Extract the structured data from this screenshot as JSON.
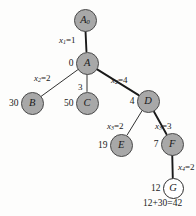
{
  "figure": {
    "type": "branch-and-bound-tree",
    "background_color": "#fdfdfc",
    "node_fill_color": "#a8a8a8",
    "node_open_color": "#ffffff",
    "edge_color": "#1a1a1a",
    "caption": "12+30=42"
  },
  "nodes": [
    {
      "id": "A0",
      "label": "A",
      "subscript": "0",
      "value": "",
      "style": "filled",
      "cx": 85,
      "cy": 20,
      "r": 11.5
    },
    {
      "id": "A",
      "label": "A",
      "subscript": "",
      "value": "0",
      "style": "filled",
      "cx": 87,
      "cy": 63,
      "r": 11.5
    },
    {
      "id": "B",
      "label": "B",
      "subscript": "",
      "value": "30",
      "style": "filled",
      "cx": 32,
      "cy": 103,
      "r": 11.5
    },
    {
      "id": "C",
      "label": "C",
      "subscript": "",
      "value": "50",
      "style": "filled",
      "cx": 87,
      "cy": 103,
      "r": 11.5
    },
    {
      "id": "D",
      "label": "D",
      "subscript": "",
      "value": "4",
      "style": "filled",
      "cx": 148,
      "cy": 101,
      "r": 11.5
    },
    {
      "id": "E",
      "label": "E",
      "subscript": "",
      "value": "19",
      "style": "filled",
      "cx": 121,
      "cy": 145,
      "r": 11.5
    },
    {
      "id": "F",
      "label": "F",
      "subscript": "",
      "value": "7",
      "style": "filled",
      "cx": 172,
      "cy": 144,
      "r": 11.5
    },
    {
      "id": "G",
      "label": "G",
      "subscript": "",
      "value": "12",
      "style": "open",
      "cx": 173,
      "cy": 188,
      "r": 10.5
    }
  ],
  "edges": [
    {
      "id": "A0-A",
      "from": "A0",
      "to": "A",
      "variable": "x",
      "sub": "1",
      "weight": "1",
      "thick": true,
      "label_x": 59,
      "label_y": 36
    },
    {
      "id": "A-B",
      "from": "A",
      "to": "B",
      "variable": "x",
      "sub": "2",
      "weight": "2",
      "thick": false,
      "label_x": 34,
      "label_y": 74
    },
    {
      "id": "A-C",
      "from": "A",
      "to": "C",
      "variable": "",
      "sub": "",
      "weight": "3",
      "thick": false,
      "label_x": 78,
      "label_y": 83
    },
    {
      "id": "A-D",
      "from": "A",
      "to": "D",
      "variable": "x",
      "sub": "2",
      "weight": "4",
      "thick": true,
      "label_x": 111,
      "label_y": 76
    },
    {
      "id": "D-E",
      "from": "D",
      "to": "E",
      "variable": "x",
      "sub": "3",
      "weight": "2",
      "thick": false,
      "label_x": 107,
      "label_y": 122
    },
    {
      "id": "D-F",
      "from": "D",
      "to": "F",
      "variable": "x",
      "sub": "3",
      "weight": "3",
      "thick": true,
      "label_x": 155,
      "label_y": 122
    },
    {
      "id": "F-G",
      "from": "F",
      "to": "G",
      "variable": "x",
      "sub": "4",
      "weight": "2",
      "thick": true,
      "label_x": 178,
      "label_y": 163
    }
  ],
  "edge_label_text": {
    "A0-A": "x₁=1",
    "A-B": "x₂=2",
    "A-C": "3",
    "A-D": "x₂=4",
    "D-E": "x₃=2",
    "D-F": "x₃=3",
    "F-G": "x₄=2"
  },
  "values": {
    "A": "0",
    "B": "30",
    "C": "50",
    "D": "4",
    "E": "19",
    "F": "7",
    "G": "12"
  }
}
